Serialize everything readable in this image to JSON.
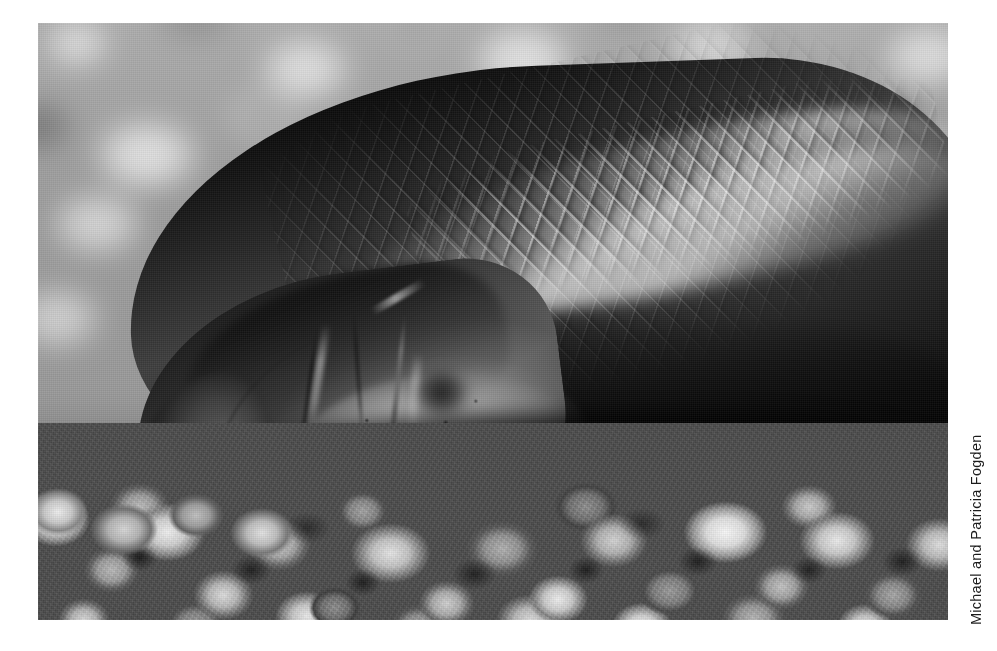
{
  "page": {
    "background_color": "#ffffff",
    "width": 997,
    "height": 651
  },
  "photo": {
    "alt_description": "Close-up black and white photograph of the blunt rounded head and scaled body of a burrowing snake resting on coarse gravel",
    "subject": "blind snake head and body on gravel",
    "treatment": "black-and-white",
    "frame": {
      "left": 38,
      "top": 23,
      "width": 910,
      "height": 597
    },
    "regions": {
      "background": "blurred out-of-focus gravel bokeh",
      "foreground": "sharply focused coarse gravel pebbles",
      "animal": "dark glossy snake, head at lower-left, body extending to upper-right"
    }
  },
  "credit": {
    "text": "Michael and Patricia Fogden",
    "orientation": "rotated-90-ccw",
    "color": "#1c1c1c"
  }
}
